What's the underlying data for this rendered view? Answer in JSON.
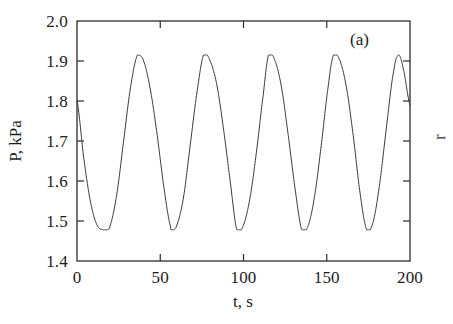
{
  "figure": {
    "panel_label": "(a)",
    "edge_glyph": "r",
    "background_color": "#ffffff",
    "frame_color": "#2b2b2b",
    "line_color": "#3a3a3a"
  },
  "chart_data": {
    "type": "line",
    "title": "",
    "subtitle": "",
    "panel": "(a)",
    "xlabel": "t, s",
    "ylabel": "P, kPa",
    "xlim": [
      0,
      200
    ],
    "ylim": [
      1.4,
      2.0
    ],
    "xticks": [
      0,
      50,
      100,
      150,
      200
    ],
    "xtick_labels": [
      "0",
      "50",
      "100",
      "150",
      "200"
    ],
    "yticks": [
      1.4,
      1.5,
      1.6,
      1.7,
      1.8,
      1.9,
      2.0
    ],
    "ytick_labels": [
      "1.4",
      "1.5",
      "1.6",
      "1.7",
      "1.8",
      "1.9",
      "2.0"
    ],
    "grid": false,
    "legend": null,
    "tick_direction": "in",
    "series": [
      {
        "name": "P(t)",
        "color": "#3a3a3a",
        "linewidth": 1,
        "description": "Self-sustained pressure oscillation, roughly sinusoidal with slightly sharpened troughs",
        "oscillation": {
          "peak_value": 1.915,
          "trough_value": 1.478,
          "mean_value": 1.697,
          "amplitude": 0.219,
          "period": 39.0,
          "start_value": 1.8,
          "peak_times": [
            37,
            76,
            115,
            154,
            193
          ],
          "trough_times": [
            18,
            57,
            96,
            135,
            174
          ],
          "cycles_shown": 5
        },
        "x": [
          0,
          4,
          8,
          12,
          16,
          18,
          20,
          24,
          28,
          32,
          36,
          37,
          40,
          44,
          48,
          52,
          56,
          57,
          60,
          64,
          68,
          72,
          76,
          80,
          84,
          88,
          92,
          96,
          100,
          104,
          108,
          112,
          115,
          119,
          123,
          127,
          131,
          135,
          139,
          143,
          147,
          151,
          154,
          158,
          162,
          166,
          170,
          174,
          178,
          182,
          186,
          190,
          193,
          196,
          200
        ],
        "y": [
          1.8,
          1.66,
          1.55,
          1.49,
          1.478,
          1.478,
          1.49,
          1.57,
          1.7,
          1.83,
          1.912,
          1.915,
          1.9,
          1.83,
          1.72,
          1.59,
          1.49,
          1.478,
          1.49,
          1.56,
          1.69,
          1.82,
          1.915,
          1.9,
          1.84,
          1.73,
          1.6,
          1.478,
          1.49,
          1.56,
          1.68,
          1.82,
          1.915,
          1.9,
          1.83,
          1.71,
          1.58,
          1.478,
          1.49,
          1.57,
          1.7,
          1.84,
          1.915,
          1.9,
          1.83,
          1.71,
          1.57,
          1.478,
          1.5,
          1.6,
          1.74,
          1.87,
          1.915,
          1.88,
          1.79
        ]
      }
    ]
  }
}
